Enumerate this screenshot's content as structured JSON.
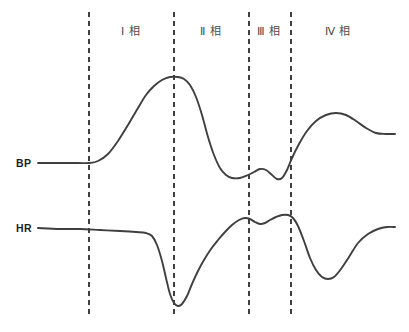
{
  "figure": {
    "width": 409,
    "height": 332,
    "background": "#ffffff",
    "curve_color": "#3f3f3f",
    "divider_color": "#111111",
    "label_color": "#4a4a4a"
  },
  "series_labels": {
    "bp": "BP",
    "hr": "HR"
  },
  "phases": [
    {
      "label": "Ⅰ 相",
      "center_x": 131
    },
    {
      "label": "Ⅱ 相",
      "center_x": 211
    },
    {
      "label": "Ⅲ 相",
      "center_x": 269
    },
    {
      "label": "Ⅳ 相",
      "center_x": 338
    }
  ],
  "chart_data": {
    "type": "line",
    "title": "",
    "subtitle": "",
    "xlabel": "",
    "ylabel": "",
    "grid": false,
    "legend_position": "left-inline",
    "axis_visible": false,
    "xlim": [
      0,
      409
    ],
    "ylim": [
      332,
      0
    ],
    "annotations": [
      {
        "text": "Ⅰ 相",
        "x": 131,
        "y": 30
      },
      {
        "text": "Ⅱ 相",
        "x": 211,
        "y": 30
      },
      {
        "text": "Ⅲ 相",
        "x": 269,
        "y": 30
      },
      {
        "text": "Ⅳ 相",
        "x": 338,
        "y": 30
      }
    ],
    "phase_dividers": [
      {
        "x": 89,
        "y_top": 12,
        "y_bottom": 315,
        "style": "dashed"
      },
      {
        "x": 174,
        "y_top": 12,
        "y_bottom": 315,
        "style": "dashed"
      },
      {
        "x": 249,
        "y_top": 12,
        "y_bottom": 315,
        "style": "dashed"
      },
      {
        "x": 291,
        "y_top": 12,
        "y_bottom": 315,
        "style": "dashed"
      }
    ],
    "series": [
      {
        "name": "BP",
        "label_x": 16,
        "label_y": 163,
        "color": "#3f3f3f",
        "baseline_y": 163,
        "points": [
          [
            38,
            163
          ],
          [
            60,
            163
          ],
          [
            78,
            163
          ],
          [
            89,
            163
          ],
          [
            98,
            161
          ],
          [
            108,
            154
          ],
          [
            118,
            141
          ],
          [
            128,
            125
          ],
          [
            138,
            108
          ],
          [
            146,
            95
          ],
          [
            154,
            86
          ],
          [
            162,
            80
          ],
          [
            170,
            77
          ],
          [
            178,
            77
          ],
          [
            184,
            79
          ],
          [
            190,
            85
          ],
          [
            196,
            97
          ],
          [
            202,
            115
          ],
          [
            208,
            137
          ],
          [
            214,
            155
          ],
          [
            220,
            168
          ],
          [
            226,
            175
          ],
          [
            232,
            178
          ],
          [
            240,
            178
          ],
          [
            248,
            175
          ],
          [
            254,
            172
          ],
          [
            260,
            169
          ],
          [
            266,
            170
          ],
          [
            272,
            175
          ],
          [
            277,
            179
          ],
          [
            282,
            178
          ],
          [
            287,
            170
          ],
          [
            292,
            158
          ],
          [
            299,
            144
          ],
          [
            307,
            131
          ],
          [
            316,
            121
          ],
          [
            326,
            115
          ],
          [
            336,
            113
          ],
          [
            346,
            115
          ],
          [
            356,
            121
          ],
          [
            366,
            128
          ],
          [
            376,
            133
          ],
          [
            386,
            134
          ],
          [
            395,
            134
          ]
        ]
      },
      {
        "name": "HR",
        "label_x": 16,
        "label_y": 228,
        "color": "#3f3f3f",
        "baseline_y": 228,
        "points": [
          [
            38,
            228
          ],
          [
            60,
            229
          ],
          [
            80,
            229
          ],
          [
            100,
            230
          ],
          [
            120,
            231
          ],
          [
            136,
            232
          ],
          [
            146,
            233
          ],
          [
            152,
            236
          ],
          [
            157,
            245
          ],
          [
            162,
            261
          ],
          [
            166,
            278
          ],
          [
            170,
            294
          ],
          [
            174,
            303
          ],
          [
            178,
            306
          ],
          [
            182,
            304
          ],
          [
            187,
            296
          ],
          [
            192,
            284
          ],
          [
            198,
            271
          ],
          [
            204,
            260
          ],
          [
            211,
            249
          ],
          [
            218,
            240
          ],
          [
            225,
            232
          ],
          [
            232,
            225
          ],
          [
            239,
            220
          ],
          [
            245,
            218
          ],
          [
            250,
            219
          ],
          [
            255,
            222
          ],
          [
            260,
            224
          ],
          [
            265,
            223
          ],
          [
            270,
            220
          ],
          [
            276,
            217
          ],
          [
            282,
            215
          ],
          [
            288,
            215
          ],
          [
            293,
            218
          ],
          [
            298,
            226
          ],
          [
            304,
            241
          ],
          [
            310,
            258
          ],
          [
            316,
            270
          ],
          [
            322,
            277
          ],
          [
            328,
            279
          ],
          [
            334,
            277
          ],
          [
            341,
            269
          ],
          [
            349,
            257
          ],
          [
            358,
            243
          ],
          [
            368,
            234
          ],
          [
            378,
            229
          ],
          [
            387,
            227
          ],
          [
            395,
            227
          ]
        ]
      }
    ]
  }
}
